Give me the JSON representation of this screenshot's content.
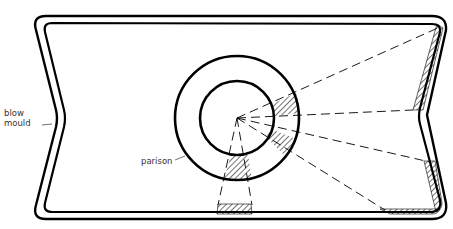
{
  "diagram": {
    "type": "cross-section",
    "labels": {
      "blow_mould": [
        "blow",
        "mould"
      ],
      "parison": "parison"
    },
    "colors": {
      "line": "#000000",
      "label": "#333333",
      "background": "#ffffff"
    },
    "parison": {
      "center": [
        237,
        118
      ],
      "outer_radius": 62,
      "inner_radius": 37
    },
    "radial_lines_count": 6
  }
}
